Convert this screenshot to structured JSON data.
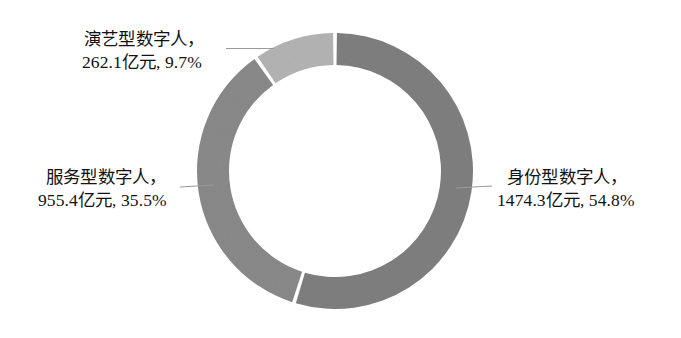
{
  "chart_data": {
    "type": "pie",
    "variant": "donut",
    "title": "",
    "subtitle": "",
    "xlabel": "",
    "ylabel": "",
    "legend": "none",
    "grid": false,
    "unit": "亿元",
    "total_value": 2691.8,
    "start_angle_deg": 0,
    "direction": "clockwise",
    "inner_radius_ratio": 0.77,
    "categories": [
      "身份型数字人",
      "服务型数字人",
      "演艺型数字人"
    ],
    "values": [
      1474.3,
      955.4,
      262.1
    ],
    "percentages": [
      54.8,
      35.5,
      9.7
    ],
    "colors": [
      "#7f7f7f",
      "#8a8a8a",
      "#b4b4b4"
    ],
    "slices": [
      {
        "name": "身份型数字人",
        "value": 1474.3,
        "value_text": "1474.3亿元",
        "percent": 54.8,
        "percent_text": "54.8%",
        "color": "#7f7f7f",
        "label_line1": "身份型数字人，",
        "label_line2": "1474.3亿元, 54.8%"
      },
      {
        "name": "服务型数字人",
        "value": 955.4,
        "value_text": "955.4亿元",
        "percent": 35.5,
        "percent_text": "35.5%",
        "color": "#8a8a8a",
        "label_line1": "服务型数字人，",
        "label_line2": "955.4亿元, 35.5%"
      },
      {
        "name": "演艺型数字人",
        "value": 262.1,
        "value_text": "262.1亿元",
        "percent": 9.7,
        "percent_text": "9.7%",
        "color": "#b4b4b4",
        "label_line1": "演艺型数字人，",
        "label_line2": "262.1亿元, 9.7%"
      }
    ]
  },
  "figure": {
    "background_color": "#ffffff",
    "slice_gap_color": "#ffffff",
    "leader_line_color": "#9a9a9a",
    "text_color": "#121212"
  }
}
